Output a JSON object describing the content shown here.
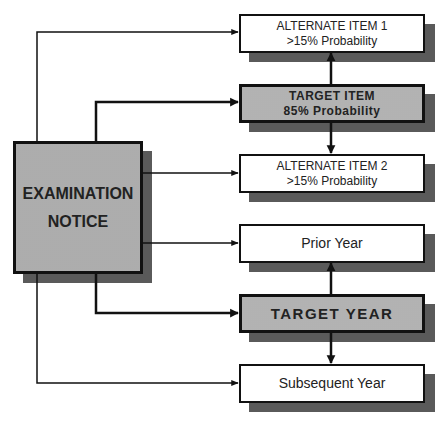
{
  "diagram": {
    "source": {
      "line1": "EXAMINATION",
      "line2": "NOTICE"
    },
    "item_group": {
      "alternate_1": {
        "title": "ALTERNATE ITEM 1",
        "subtitle": ">15% Probability"
      },
      "target": {
        "title": "TARGET ITEM",
        "subtitle": "85% Probability"
      },
      "alternate_2": {
        "title": "ALTERNATE ITEM 2",
        "subtitle": ">15% Probability"
      }
    },
    "year_group": {
      "prior": {
        "title": "Prior Year"
      },
      "target": {
        "title": "TARGET YEAR"
      },
      "subsequent": {
        "title": "Subsequent Year"
      }
    },
    "colors": {
      "stroke": "#111111",
      "target_fill": "#d2d2d2",
      "shadow": "#8a8a8a",
      "background": "#ffffff"
    }
  }
}
